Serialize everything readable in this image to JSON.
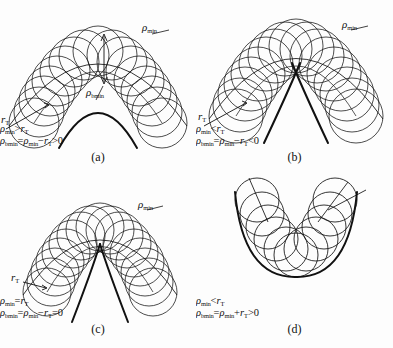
{
  "figure": {
    "background_color": "#fdfdfd",
    "line_color": "#111111"
  },
  "symbols": {
    "rho": "ρ",
    "r": "r",
    "sub_min": "min",
    "sub_bmin": "bmin",
    "sub_T": "T"
  },
  "panels": [
    {
      "id": "a",
      "caption": "(a)",
      "labels": {
        "rho_min": "ρ",
        "rho_min_sub": "min",
        "rho_bmin": "ρ",
        "rho_bmin_sub": "bmin",
        "r_T": "r",
        "r_T_sub": "T"
      },
      "equations": [
        {
          "parts": [
            "ρ",
            "min",
            " > ",
            "r",
            "T"
          ],
          "text": "ρmin > rT"
        },
        {
          "parts": [
            "ρ",
            "bmin",
            " = ",
            "ρ",
            "min",
            " − ",
            "r",
            "T",
            " > 0"
          ],
          "text": "ρbmin = ρmin − rT > 0"
        }
      ],
      "relation": "rho_min greater than r_T",
      "sign": "positive",
      "shape": "inverted parabola, arch with open rounded vertex"
    },
    {
      "id": "b",
      "caption": "(b)",
      "labels": {
        "rho_min": "ρ",
        "rho_min_sub": "min",
        "r_T": "r",
        "r_T_sub": "T"
      },
      "equations": [
        {
          "parts": [
            "ρ",
            "min",
            " < ",
            "r",
            "T"
          ],
          "text": "ρmin < rT"
        },
        {
          "parts": [
            "ρ",
            "bmin",
            " = ",
            "ρ",
            "min",
            " − ",
            "r",
            "T",
            " < 0"
          ],
          "text": "ρbmin = ρmin − rT < 0"
        }
      ],
      "relation": "rho_min less than r_T",
      "sign": "negative",
      "shape": "inverted parabola, envelope crosses forming a cusp below vertex"
    },
    {
      "id": "c",
      "caption": "(c)",
      "labels": {
        "rho_min": "ρ",
        "rho_min_sub": "min",
        "r_T": "r",
        "r_T_sub": "T"
      },
      "equations": [
        {
          "parts": [
            "ρ",
            "min",
            " = ",
            "r",
            "T"
          ],
          "text": "ρmin = rT"
        },
        {
          "parts": [
            "ρ",
            "bmin",
            " = ",
            "ρ",
            "min",
            " − ",
            "r",
            "T",
            " = 0"
          ],
          "text": "ρbmin = ρmin − rT = 0"
        }
      ],
      "relation": "rho_min equals r_T",
      "sign": "zero",
      "shape": "inverted parabola, envelope meets exactly at a single point"
    },
    {
      "id": "d",
      "caption": "(d)",
      "labels": {},
      "equations": [
        {
          "parts": [
            "ρ",
            "min",
            " < ",
            "r",
            "T"
          ],
          "text": "ρmin < rT"
        },
        {
          "parts": [
            "ρ",
            "bmin",
            " = ",
            "ρ",
            "min",
            " + ",
            "r",
            "T",
            " > 0"
          ],
          "text": "ρbmin = ρmin + rT > 0"
        }
      ],
      "relation": "rho_min less than r_T",
      "sign": "positive",
      "shape": "upright U-shaped parabola with outer bold envelope"
    }
  ]
}
